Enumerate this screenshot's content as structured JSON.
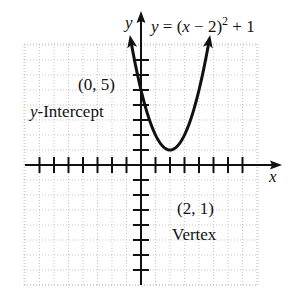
{
  "chart_data": {
    "type": "line",
    "equation": {
      "lhs": "y",
      "equals": "=",
      "base": "(x − 2)",
      "exponent": "2",
      "tail": "+ 1"
    },
    "xlabel": "x",
    "ylabel": "y",
    "xlim": [
      -8,
      9
    ],
    "ylim": [
      -8,
      8
    ],
    "grid": true,
    "x_ticks": [
      -7,
      -6,
      -5,
      -4,
      -3,
      -2,
      -1,
      1,
      2,
      3,
      4,
      5,
      6,
      7
    ],
    "y_ticks": [
      -7,
      -6,
      -5,
      -4,
      -3,
      -2,
      -1,
      1,
      2,
      3,
      4,
      5,
      6,
      7
    ],
    "series": [
      {
        "name": "y = (x − 2)² + 1",
        "x": [
          -0.77,
          -0.5,
          0,
          0.5,
          1,
          1.5,
          2,
          2.5,
          3,
          3.5,
          4,
          4.5,
          4.77
        ],
        "y": [
          8.67,
          7.25,
          5,
          3.25,
          2,
          1.25,
          1,
          1.25,
          2,
          3.25,
          5,
          7.25,
          8.67
        ]
      }
    ],
    "annotations": [
      {
        "point": [
          0,
          5
        ],
        "label": "(0, 5)",
        "sublabel": "y-Intercept"
      },
      {
        "point": [
          2,
          1
        ],
        "label": "(2, 1)",
        "sublabel": "Vertex"
      }
    ]
  },
  "labels": {
    "y_axis": "y",
    "x_axis": "x",
    "eq_y": "y",
    "eq_eq": " = (",
    "eq_x": "x",
    "eq_rest": " − 2)",
    "eq_sup": "2",
    "eq_tail": " + 1",
    "intercept_point": "(0, 5)",
    "intercept_y": "y",
    "intercept_text": "-Intercept",
    "vertex_point": "(2, 1)",
    "vertex_text": "Vertex"
  },
  "colors": {
    "ink": "#111111",
    "grid": "#b5b5b5",
    "background": "#ffffff"
  }
}
